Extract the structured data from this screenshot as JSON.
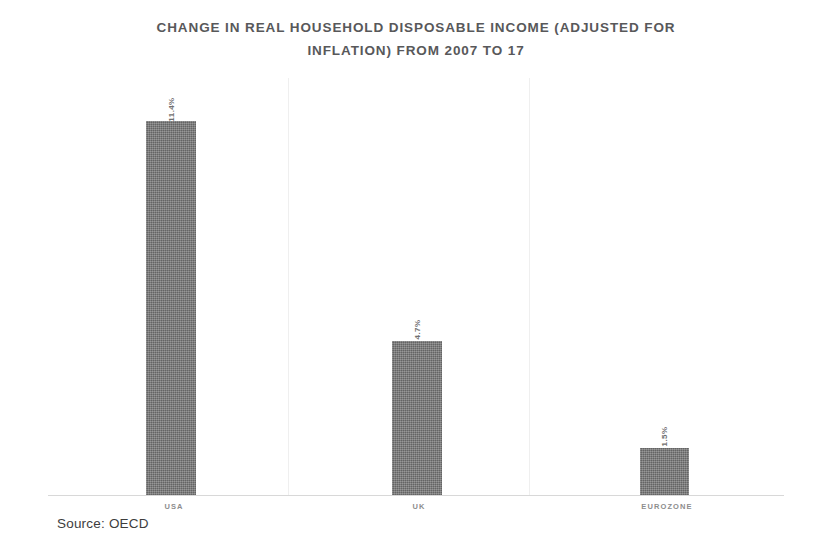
{
  "chart_data": {
    "type": "bar",
    "title": "CHANGE IN REAL HOUSEHOLD DISPOSABLE INCOME (ADJUSTED FOR\nINFLATION) FROM 2007 TO 17",
    "xlabel": "",
    "ylabel": "",
    "categories": [
      "USA",
      "UK",
      "EUROZONE"
    ],
    "values": [
      11.4,
      4.7,
      1.5
    ],
    "value_labels": [
      "11.4%",
      "4.7%",
      "1.5%"
    ],
    "ylim": [
      0,
      12
    ],
    "grid": false,
    "legend": null,
    "series": [
      {
        "name": "Change in real household disposable income",
        "values": [
          11.4,
          4.7,
          1.5
        ]
      }
    ],
    "annotations": [
      "Source: OECD"
    ],
    "bar_color": "#6f6f6f",
    "title_color": "#58585a",
    "axis_color": "#d8d8d8",
    "separator_color": "#efefef"
  },
  "caption": {
    "source": "Source: OECD"
  }
}
